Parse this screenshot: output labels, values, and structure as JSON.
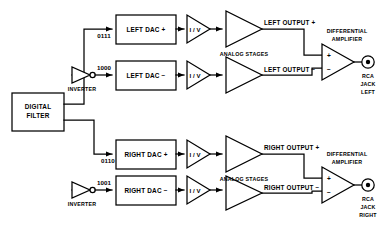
{
  "diagram": {
    "colors": {
      "ink": "#000000",
      "paper": "#ffffff"
    },
    "blocks": {
      "digital_filter": "DIGITAL\nFILTER",
      "digital_filter_line1": "DIGITAL",
      "digital_filter_line2": "FILTER",
      "left_dac_plus": "LEFT DAC +",
      "left_dac_minus": "LEFT DAC −",
      "right_dac_plus": "RIGHT DAC +",
      "right_dac_minus": "RIGHT DAC −"
    },
    "inverters": {
      "label": "INVERTER",
      "left_label": "INVERTER",
      "right_label": "INVERTER"
    },
    "codes": {
      "left_direct": "0111",
      "left_inverted": "1000",
      "right_direct": "0110",
      "right_inverted": "1001"
    },
    "iv_stages": {
      "label": "I / V",
      "left_plus": "I / V",
      "left_minus": "I / V",
      "right_plus": "I / V",
      "right_minus": "I / V"
    },
    "analog_stages": {
      "label": "ANALOG STAGES",
      "left": "ANALOG STAGES",
      "right": "ANALOG STAGES"
    },
    "outputs": {
      "left_plus": "LEFT OUTPUT +",
      "left_minus": "LEFT OUTPUT −",
      "right_plus": "RIGHT OUTPUT +",
      "right_minus": "RIGHT OUTPUT −"
    },
    "differential_amplifier": {
      "line1": "DIFFERENTIAL",
      "line2": "AMPLIFIER",
      "input_plus": "+",
      "input_minus": "−"
    },
    "jacks": {
      "left": {
        "line1": "RCA",
        "line2": "JACK",
        "line3": "LEFT"
      },
      "right": {
        "line1": "RCA",
        "line2": "JACK",
        "line3": "RIGHT"
      }
    }
  }
}
